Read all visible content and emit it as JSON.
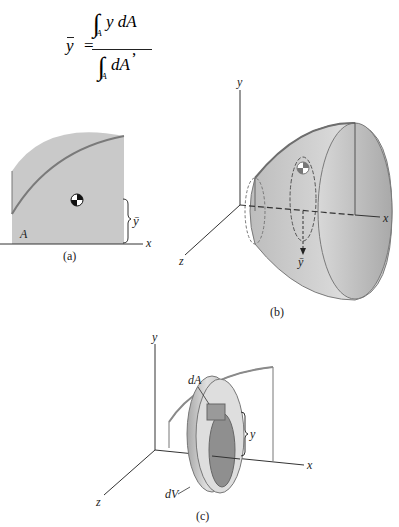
{
  "formula": {
    "lhs": "y",
    "equals": "=",
    "numerator_integrand": "y dA",
    "denominator_integrand": "dA",
    "integral_sub": "A",
    "trailing": ","
  },
  "figure_a": {
    "caption": "(a)",
    "area_label": "A",
    "centroid_label": "ȳ",
    "x_axis_label": "x"
  },
  "figure_b": {
    "caption": "(b)",
    "x_axis_label": "x",
    "y_axis_label": "y",
    "z_axis_label": "z",
    "centroid_label": "ȳ"
  },
  "figure_c": {
    "caption": "(c)",
    "x_axis_label": "x",
    "y_axis_label": "y",
    "z_axis_label": "z",
    "area_element_label": "dA",
    "volume_element_label": "dV",
    "distance_label": "y"
  },
  "colors": {
    "fill_gray": "#c8c8c8",
    "edge_gray": "#7a7a7a",
    "ink": "#222222"
  }
}
